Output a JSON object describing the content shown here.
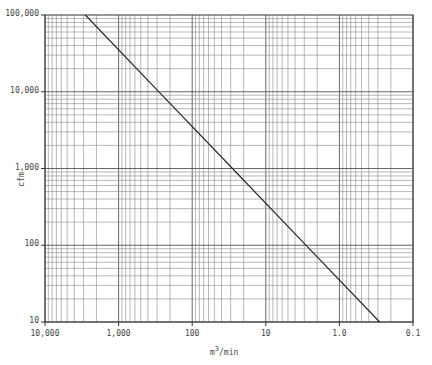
{
  "chart_data": {
    "type": "line",
    "title": "",
    "xlabel": "m³/min",
    "xlabel_base": "m",
    "xlabel_sup": "3",
    "xlabel_rest": "/min",
    "ylabel": "cfm",
    "xscale": "log",
    "yscale": "log",
    "x_reversed": true,
    "xlim": [
      10000,
      0.1
    ],
    "ylim": [
      10,
      100000
    ],
    "grid": true,
    "x_ticks": [
      10000,
      1000,
      100,
      10,
      1.0,
      0.1
    ],
    "x_tick_labels": [
      "10,000",
      "1,000",
      "100",
      "10",
      "1.0",
      "0.1"
    ],
    "y_ticks": [
      100000,
      10000,
      1000,
      100,
      10
    ],
    "y_tick_labels": [
      "100,000",
      "10,000",
      "1,000",
      "100",
      "10"
    ],
    "series": [
      {
        "name": "cfm vs m³/min",
        "x": [
          2832,
          283.2,
          28.32,
          2.832,
          0.2832
        ],
        "y": [
          100000,
          10000,
          1000,
          100,
          10
        ]
      }
    ]
  }
}
